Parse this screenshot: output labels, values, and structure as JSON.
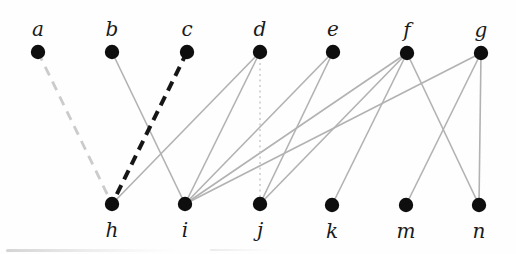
{
  "canvas": {
    "width": 516,
    "height": 254,
    "background": "#fefefe"
  },
  "graph": {
    "type": "bipartite-graph",
    "top_row_labels": [
      "a",
      "b",
      "c",
      "d",
      "e",
      "f",
      "g"
    ],
    "bottom_row_labels": [
      "h",
      "i",
      "j",
      "k",
      "m",
      "n"
    ],
    "node_style": {
      "radius": 7.2,
      "color": "#0e0e0e"
    },
    "label_font_size": 20,
    "styles": {
      "solid": {
        "color": "#b2b2b2",
        "width": 1.6,
        "dash": ""
      },
      "dotted": {
        "color": "#c2c2c2",
        "width": 1.3,
        "dash": "2 3.5"
      },
      "light-dashed": {
        "color": "#cbcbcb",
        "width": 2.8,
        "dash": "9.5 7"
      },
      "black-dashed": {
        "color": "#161616",
        "width": 4.0,
        "dash": "10 6.5"
      }
    },
    "nodes": [
      {
        "id": "a",
        "label": "a",
        "x": 38,
        "y": 52,
        "row": "top"
      },
      {
        "id": "b",
        "label": "b",
        "x": 112,
        "y": 52,
        "row": "top"
      },
      {
        "id": "c",
        "label": "c",
        "x": 187,
        "y": 52,
        "row": "top"
      },
      {
        "id": "d",
        "label": "d",
        "x": 260,
        "y": 52,
        "row": "top"
      },
      {
        "id": "e",
        "label": "e",
        "x": 333,
        "y": 52,
        "row": "top"
      },
      {
        "id": "f",
        "label": "f",
        "x": 407,
        "y": 53,
        "row": "top"
      },
      {
        "id": "g",
        "label": "g",
        "x": 481,
        "y": 53,
        "row": "top"
      },
      {
        "id": "h",
        "label": "h",
        "x": 112,
        "y": 204,
        "row": "bottom"
      },
      {
        "id": "i",
        "label": "i",
        "x": 185,
        "y": 204,
        "row": "bottom"
      },
      {
        "id": "j",
        "label": "j",
        "x": 260,
        "y": 204,
        "row": "bottom"
      },
      {
        "id": "k",
        "label": "k",
        "x": 332,
        "y": 205,
        "row": "bottom"
      },
      {
        "id": "m",
        "label": "m",
        "x": 406,
        "y": 205,
        "row": "bottom"
      },
      {
        "id": "n",
        "label": "n",
        "x": 479,
        "y": 205,
        "row": "bottom"
      }
    ],
    "edges": [
      {
        "from": "b",
        "to": "i",
        "style": "solid"
      },
      {
        "from": "d",
        "to": "h",
        "style": "solid"
      },
      {
        "from": "d",
        "to": "i",
        "style": "solid"
      },
      {
        "from": "e",
        "to": "i",
        "style": "solid"
      },
      {
        "from": "e",
        "to": "j",
        "style": "solid"
      },
      {
        "from": "f",
        "to": "i",
        "style": "solid"
      },
      {
        "from": "f",
        "to": "j",
        "style": "solid"
      },
      {
        "from": "f",
        "to": "k",
        "style": "solid"
      },
      {
        "from": "f",
        "to": "n",
        "style": "solid"
      },
      {
        "from": "g",
        "to": "i",
        "style": "solid"
      },
      {
        "from": "g",
        "to": "m",
        "style": "solid"
      },
      {
        "from": "g",
        "to": "n",
        "style": "solid"
      },
      {
        "from": "d",
        "to": "j",
        "style": "dotted"
      },
      {
        "from": "a",
        "to": "h",
        "style": "light-dashed"
      },
      {
        "from": "c",
        "to": "h",
        "style": "black-dashed"
      }
    ]
  }
}
